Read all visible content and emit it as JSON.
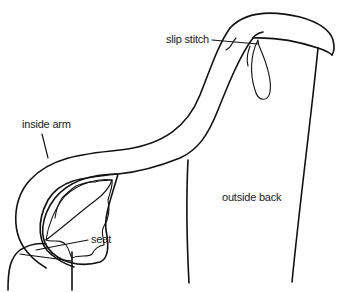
{
  "diagram": {
    "colors": {
      "line": "#111111",
      "background": "#ffffff",
      "text": "#1a1a1a"
    },
    "labels": [
      {
        "id": "slip-stitch",
        "text": "slip stitch"
      },
      {
        "id": "inside-arm",
        "text": "inside arm"
      },
      {
        "id": "seat",
        "text": "seat"
      },
      {
        "id": "outside-back",
        "text": "outside back"
      }
    ]
  }
}
